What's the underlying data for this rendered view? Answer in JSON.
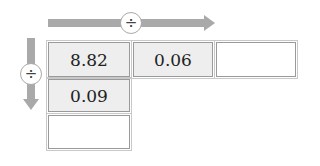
{
  "diagram": {
    "horizontal_arrow": {
      "direction": "right",
      "operator_symbol": "÷",
      "operator_icon": "divide-icon",
      "color": "#a9a9a9"
    },
    "vertical_arrow": {
      "direction": "down",
      "operator_symbol": "÷",
      "operator_icon": "divide-icon",
      "color": "#a9a9a9"
    },
    "grid": {
      "row1": [
        "8.82",
        "0.06",
        ""
      ],
      "col1": [
        "8.82",
        "0.09",
        ""
      ],
      "cells": [
        {
          "row": 1,
          "col": 1,
          "value": "8.82",
          "filled": true
        },
        {
          "row": 1,
          "col": 2,
          "value": "0.06",
          "filled": true
        },
        {
          "row": 1,
          "col": 3,
          "value": "",
          "filled": false
        },
        {
          "row": 2,
          "col": 1,
          "value": "0.09",
          "filled": true
        },
        {
          "row": 3,
          "col": 1,
          "value": "",
          "filled": false
        }
      ]
    },
    "colors": {
      "filled_cell": "#eeeeee",
      "empty_cell": "#ffffff",
      "border": "#9a9a9a"
    }
  }
}
